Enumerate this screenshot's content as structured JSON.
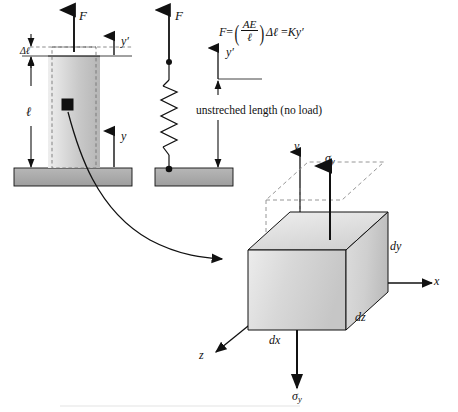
{
  "figure": {
    "equation": {
      "lhs": "F",
      "equals1": "=",
      "numerator": "AE",
      "denominator": "ℓ",
      "delta_l": "Δℓ",
      "equals2": "=",
      "rhs": "Ky′"
    }
  },
  "bar_diagram": {
    "force_label": "F",
    "delta_length_label": "Δℓ",
    "length_label": "ℓ",
    "axis_y_prime_label": "y′",
    "axis_y_label": "y",
    "element_marker_name": "stress-element-marker"
  },
  "spring_diagram": {
    "force_label": "F",
    "axis_y_prime_label": "y′",
    "unstretched_label": "unstreched length (no load)"
  },
  "stress_element": {
    "axis_x_label": "x",
    "axis_y_label": "y",
    "axis_z_label": "z",
    "sigma_top": "σ",
    "sigma_top_sub": "y",
    "sigma_bottom": "σ",
    "sigma_bottom_sub": "y",
    "dx_label": "dx",
    "dy_label": "dy",
    "dz_label": "dz"
  },
  "colors": {
    "line": "#111111",
    "bar_fill_light": "#e9e9e9",
    "bar_fill_dark": "#b4b4b4",
    "ground_fill": "#a9a9a9",
    "cube_face_front": "#d5d5d5",
    "cube_face_side": "#c2c2c2",
    "cube_face_top": "#e4e4e4",
    "dashed": "#7a7a7a",
    "background": "#ffffff"
  }
}
